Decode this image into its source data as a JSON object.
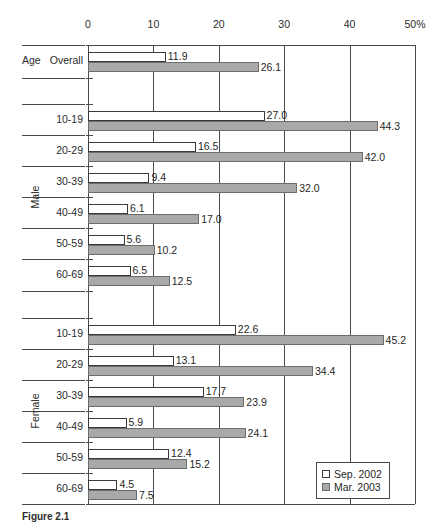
{
  "chart_data": {
    "type": "bar",
    "orientation": "horizontal",
    "title": "",
    "xlabel": "",
    "ylabel": "",
    "xlim": [
      0,
      50
    ],
    "xticks": [
      0,
      10,
      20,
      30,
      40,
      50
    ],
    "xtick_labels": [
      "0",
      "10",
      "20",
      "30",
      "40",
      "50%"
    ],
    "grid": true,
    "legend_position": "lower-right",
    "categories": [
      "Overall",
      "10-19",
      "20-29",
      "30-39",
      "40-49",
      "50-59",
      "60-69",
      "10-19",
      "20-29",
      "30-39",
      "40-49",
      "50-59",
      "60-69"
    ],
    "groups": [
      {
        "name": "Age",
        "categories": [
          "Overall"
        ]
      },
      {
        "name": "Male",
        "categories": [
          "10-19",
          "20-29",
          "30-39",
          "40-49",
          "50-59",
          "60-69"
        ]
      },
      {
        "name": "Female",
        "categories": [
          "10-19",
          "20-29",
          "30-39",
          "40-49",
          "50-59",
          "60-69"
        ]
      }
    ],
    "series": [
      {
        "name": "Sep. 2002",
        "color": "#ffffff",
        "edge_color": "#3a3a3a",
        "values": [
          11.9,
          27.0,
          16.5,
          9.4,
          6.1,
          5.6,
          6.5,
          22.6,
          13.1,
          17.7,
          5.9,
          12.4,
          4.5
        ]
      },
      {
        "name": "Mar. 2003",
        "color": "#a9a9a9",
        "edge_color": "#6d6d6d",
        "values": [
          26.1,
          44.3,
          42.0,
          32.0,
          17.0,
          10.2,
          12.5,
          45.2,
          34.4,
          23.9,
          24.1,
          15.2,
          7.5
        ]
      }
    ],
    "value_labels": {
      "Sep. 2002": [
        "11.9",
        "27.0",
        "16.5",
        "9.4",
        "6.1",
        "5.6",
        "6.5",
        "22.6",
        "13.1",
        "17.7",
        "5.9",
        "12.4",
        "4.5"
      ],
      "Mar. 2003": [
        "26.1",
        "44.3",
        "42.0",
        "32.0",
        "17.0",
        "10.2",
        "12.5",
        "45.2",
        "34.4",
        "23.9",
        "24.1",
        "15.2",
        "7.5"
      ]
    }
  },
  "legend": {
    "items": [
      {
        "label": "Sep. 2002",
        "swatch": "open-square-swatch"
      },
      {
        "label": "Mar. 2003",
        "swatch": "filled-square-swatch"
      }
    ]
  },
  "caption": {
    "text": "Figure 2.1"
  },
  "colors": {
    "series_a_fill": "#ffffff",
    "series_a_edge": "#3a3a3a",
    "series_b_fill": "#a9a9a9",
    "series_b_edge": "#6d6d6d",
    "axis": "#4a4a4a",
    "text": "#1f1f1f"
  }
}
